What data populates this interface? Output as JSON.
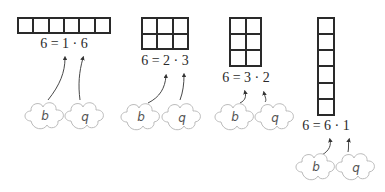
{
  "groups": [
    {
      "rows": 1,
      "cols": 6,
      "equation": "6 = 1 · 6",
      "b": "b",
      "q": "q"
    },
    {
      "rows": 2,
      "cols": 3,
      "equation": "6 = 2 · 3",
      "b": "b",
      "q": "q"
    },
    {
      "rows": 3,
      "cols": 2,
      "equation": "6 = 3 · 2",
      "b": "b",
      "q": "q"
    },
    {
      "rows": 6,
      "cols": 1,
      "equation": "6 = 6 · 1",
      "b": "b",
      "q": "q"
    }
  ]
}
